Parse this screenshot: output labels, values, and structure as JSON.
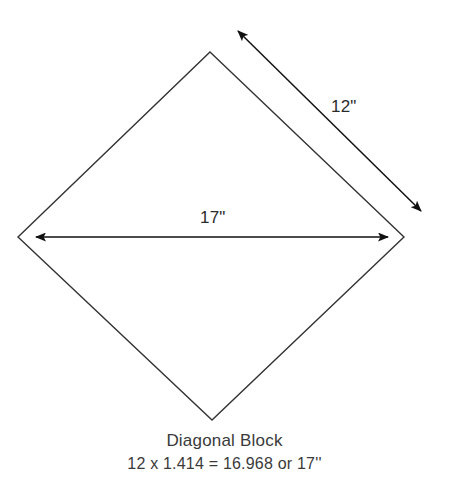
{
  "canvas": {
    "width": 449,
    "height": 501,
    "background_color": "#ffffff"
  },
  "diagram": {
    "name": "diagonal-block",
    "shape": "diamond",
    "line_color": "#333333",
    "line_width": 1.4,
    "vertices": {
      "top": [
        210,
        52
      ],
      "right": [
        404,
        237
      ],
      "bottom": [
        212,
        420
      ],
      "left": [
        18,
        237
      ]
    }
  },
  "dimensions": [
    {
      "id": "side",
      "label": "12\"",
      "orientation": "diagonal",
      "arrow_start": [
        238,
        31
      ],
      "arrow_end": [
        421,
        211
      ],
      "arrowheads": "both",
      "label_position": [
        331,
        97
      ]
    },
    {
      "id": "diagonal",
      "label": "17\"",
      "orientation": "horizontal",
      "arrow_start": [
        36,
        237
      ],
      "arrow_end": [
        388,
        237
      ],
      "arrowheads": "both",
      "label_position": [
        200,
        208
      ]
    }
  ],
  "caption": {
    "title": "Diagonal Block",
    "formula": "12 x 1.414 = 16.968 or 17''"
  }
}
